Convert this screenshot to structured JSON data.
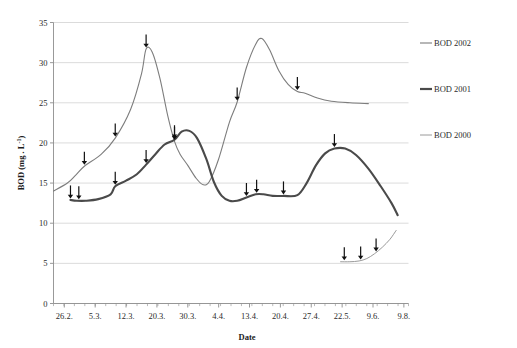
{
  "chart_data": {
    "type": "line",
    "title": "",
    "xlabel": "Date",
    "ylabel": "BOD (mg . L-1)",
    "ylabel_display": "BOD (mg . L",
    "ylabel_sup": "-1",
    "ylabel_tail": ")",
    "ylim": [
      0,
      35
    ],
    "ytick_step": 5,
    "yticks": [
      "0",
      "5",
      "10",
      "15",
      "20",
      "25",
      "30",
      "35"
    ],
    "grid": "horizontal",
    "legend_position": "right",
    "categories": [
      "26.2.",
      "5.3.",
      "12.3.",
      "20.3.",
      "30.3.",
      "4.4.",
      "13.4.",
      "20.4.",
      "27.4.",
      "22.5.",
      "9.6.",
      "9.8."
    ],
    "xtick_labels": [
      "26.2.",
      "5.3.",
      "12.3.",
      "20.3.",
      "30.3.",
      "4.4.",
      "13.4.",
      "20.4.",
      "27.4.",
      "22.5.",
      "9.6.",
      "9.8."
    ],
    "series": [
      {
        "name": "BOD 2002",
        "color": "#7d7d7d",
        "width": 1.1,
        "points": [
          {
            "x": 0.0,
            "y": 14.0
          },
          {
            "x": 0.45,
            "y": 15.0
          },
          {
            "x": 0.72,
            "y": 16.0
          },
          {
            "x": 1.0,
            "y": 17.1
          },
          {
            "x": 1.55,
            "y": 18.6
          },
          {
            "x": 2.0,
            "y": 20.6
          },
          {
            "x": 2.5,
            "y": 24.2
          },
          {
            "x": 2.85,
            "y": 28.6
          },
          {
            "x": 3.0,
            "y": 31.7
          },
          {
            "x": 3.2,
            "y": 31.3
          },
          {
            "x": 3.45,
            "y": 28.0
          },
          {
            "x": 3.7,
            "y": 23.4
          },
          {
            "x": 3.92,
            "y": 20.2
          },
          {
            "x": 4.1,
            "y": 18.6
          },
          {
            "x": 4.35,
            "y": 17.2
          },
          {
            "x": 4.62,
            "y": 15.6
          },
          {
            "x": 4.85,
            "y": 14.8
          },
          {
            "x": 5.05,
            "y": 15.2
          },
          {
            "x": 5.35,
            "y": 18.0
          },
          {
            "x": 5.7,
            "y": 22.6
          },
          {
            "x": 5.95,
            "y": 25.1
          },
          {
            "x": 6.25,
            "y": 29.4
          },
          {
            "x": 6.55,
            "y": 32.3
          },
          {
            "x": 6.75,
            "y": 33.0
          },
          {
            "x": 7.0,
            "y": 31.6
          },
          {
            "x": 7.3,
            "y": 29.0
          },
          {
            "x": 7.6,
            "y": 27.3
          },
          {
            "x": 7.9,
            "y": 26.4
          },
          {
            "x": 8.15,
            "y": 26.2
          },
          {
            "x": 8.55,
            "y": 25.6
          },
          {
            "x": 9.0,
            "y": 25.2
          },
          {
            "x": 9.6,
            "y": 25.0
          },
          {
            "x": 10.2,
            "y": 24.9
          }
        ],
        "arrows": [
          {
            "x": 1.0,
            "y": 17.1
          },
          {
            "x": 2.0,
            "y": 20.6
          },
          {
            "x": 3.0,
            "y": 31.7
          },
          {
            "x": 3.92,
            "y": 20.2
          },
          {
            "x": 5.95,
            "y": 25.1
          },
          {
            "x": 7.9,
            "y": 26.4
          }
        ]
      },
      {
        "name": "BOD 2001",
        "color": "#4a4a4a",
        "width": 2.1,
        "points": [
          {
            "x": 0.55,
            "y": 12.9
          },
          {
            "x": 0.75,
            "y": 12.8
          },
          {
            "x": 1.05,
            "y": 12.8
          },
          {
            "x": 1.45,
            "y": 13.0
          },
          {
            "x": 1.85,
            "y": 13.6
          },
          {
            "x": 2.0,
            "y": 14.6
          },
          {
            "x": 2.35,
            "y": 15.3
          },
          {
            "x": 2.7,
            "y": 16.1
          },
          {
            "x": 3.0,
            "y": 17.3
          },
          {
            "x": 3.3,
            "y": 18.6
          },
          {
            "x": 3.6,
            "y": 19.8
          },
          {
            "x": 3.92,
            "y": 20.4
          },
          {
            "x": 4.15,
            "y": 21.4
          },
          {
            "x": 4.4,
            "y": 21.5
          },
          {
            "x": 4.65,
            "y": 20.6
          },
          {
            "x": 4.95,
            "y": 18.0
          },
          {
            "x": 5.2,
            "y": 15.1
          },
          {
            "x": 5.45,
            "y": 13.4
          },
          {
            "x": 5.7,
            "y": 12.8
          },
          {
            "x": 5.95,
            "y": 12.8
          },
          {
            "x": 6.25,
            "y": 13.2
          },
          {
            "x": 6.55,
            "y": 13.6
          },
          {
            "x": 6.8,
            "y": 13.6
          },
          {
            "x": 7.1,
            "y": 13.4
          },
          {
            "x": 7.45,
            "y": 13.4
          },
          {
            "x": 7.9,
            "y": 13.5
          },
          {
            "x": 8.2,
            "y": 15.0
          },
          {
            "x": 8.5,
            "y": 17.2
          },
          {
            "x": 8.8,
            "y": 18.7
          },
          {
            "x": 9.1,
            "y": 19.3
          },
          {
            "x": 9.45,
            "y": 19.3
          },
          {
            "x": 9.8,
            "y": 18.5
          },
          {
            "x": 10.2,
            "y": 16.8
          },
          {
            "x": 10.6,
            "y": 14.6
          },
          {
            "x": 10.95,
            "y": 12.5
          },
          {
            "x": 11.15,
            "y": 11.0
          }
        ],
        "arrows": [
          {
            "x": 0.55,
            "y": 12.9
          },
          {
            "x": 0.82,
            "y": 12.8
          },
          {
            "x": 2.0,
            "y": 14.6
          },
          {
            "x": 3.0,
            "y": 17.3
          },
          {
            "x": 3.92,
            "y": 20.4
          },
          {
            "x": 6.25,
            "y": 13.2
          },
          {
            "x": 6.58,
            "y": 13.6
          },
          {
            "x": 7.45,
            "y": 13.4
          },
          {
            "x": 9.1,
            "y": 19.3
          }
        ]
      },
      {
        "name": "BOD 2000",
        "color": "#9a9a9a",
        "width": 1.0,
        "points": [
          {
            "x": 9.3,
            "y": 5.2
          },
          {
            "x": 9.6,
            "y": 5.2
          },
          {
            "x": 9.9,
            "y": 5.3
          },
          {
            "x": 10.15,
            "y": 5.6
          },
          {
            "x": 10.4,
            "y": 6.2
          },
          {
            "x": 10.65,
            "y": 7.0
          },
          {
            "x": 10.9,
            "y": 8.0
          },
          {
            "x": 11.1,
            "y": 9.1
          }
        ],
        "arrows": [
          {
            "x": 9.42,
            "y": 5.2
          },
          {
            "x": 9.95,
            "y": 5.3
          },
          {
            "x": 10.45,
            "y": 6.3
          }
        ]
      }
    ]
  },
  "legend": {
    "items": [
      {
        "label": "BOD 2002",
        "color": "#7d7d7d",
        "width": 1.1
      },
      {
        "label": "BOD 2001",
        "color": "#4a4a4a",
        "width": 2.2
      },
      {
        "label": "BOD 2000",
        "color": "#9a9a9a",
        "width": 1.0
      }
    ]
  }
}
